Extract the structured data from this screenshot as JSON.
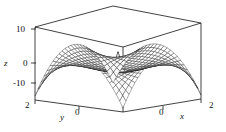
{
  "figure": {
    "kind": "3d-surface-mesh-plot",
    "background_color": "#ffffff",
    "line_color": "#000000",
    "box_color": "#000000"
  },
  "axes": {
    "z": {
      "title": "z",
      "ticks": [
        "10",
        "0",
        "-10"
      ],
      "tick_values": [
        10,
        0,
        -10
      ],
      "range": [
        -15,
        15
      ]
    },
    "y": {
      "title": "y",
      "ticks": [
        "2",
        "0"
      ],
      "tick_values": [
        2,
        0
      ],
      "range": [
        -2,
        2
      ]
    },
    "x": {
      "title": "x",
      "ticks": [
        "0",
        "2"
      ],
      "tick_values": [
        0,
        2
      ],
      "range": [
        -2,
        2
      ]
    }
  },
  "chart_data": {
    "type": "surface",
    "title": "",
    "xlabel": "x",
    "ylabel": "y",
    "zlabel": "z",
    "xlim": [
      -2,
      2
    ],
    "ylim": [
      -2,
      2
    ],
    "zlim": [
      -15,
      15
    ],
    "xticks": [
      0,
      2
    ],
    "yticks": [
      0,
      2
    ],
    "zticks": [
      -10,
      0,
      10
    ],
    "grid": false,
    "legend": null,
    "mesh": {
      "nx": 26,
      "ny": 26,
      "style": "wireframe",
      "color": "#000000"
    },
    "projection": {
      "azimuth_deg": -45,
      "elevation_deg": 20
    },
    "surface_corners_z": {
      "x_-2_y_-2": 15,
      "x_2_y_-2": 15,
      "x_-2_y_2": 15,
      "x_2_y_2": 15,
      "center_x_0_y_0": 0,
      "spike_peak_z": 9
    }
  }
}
